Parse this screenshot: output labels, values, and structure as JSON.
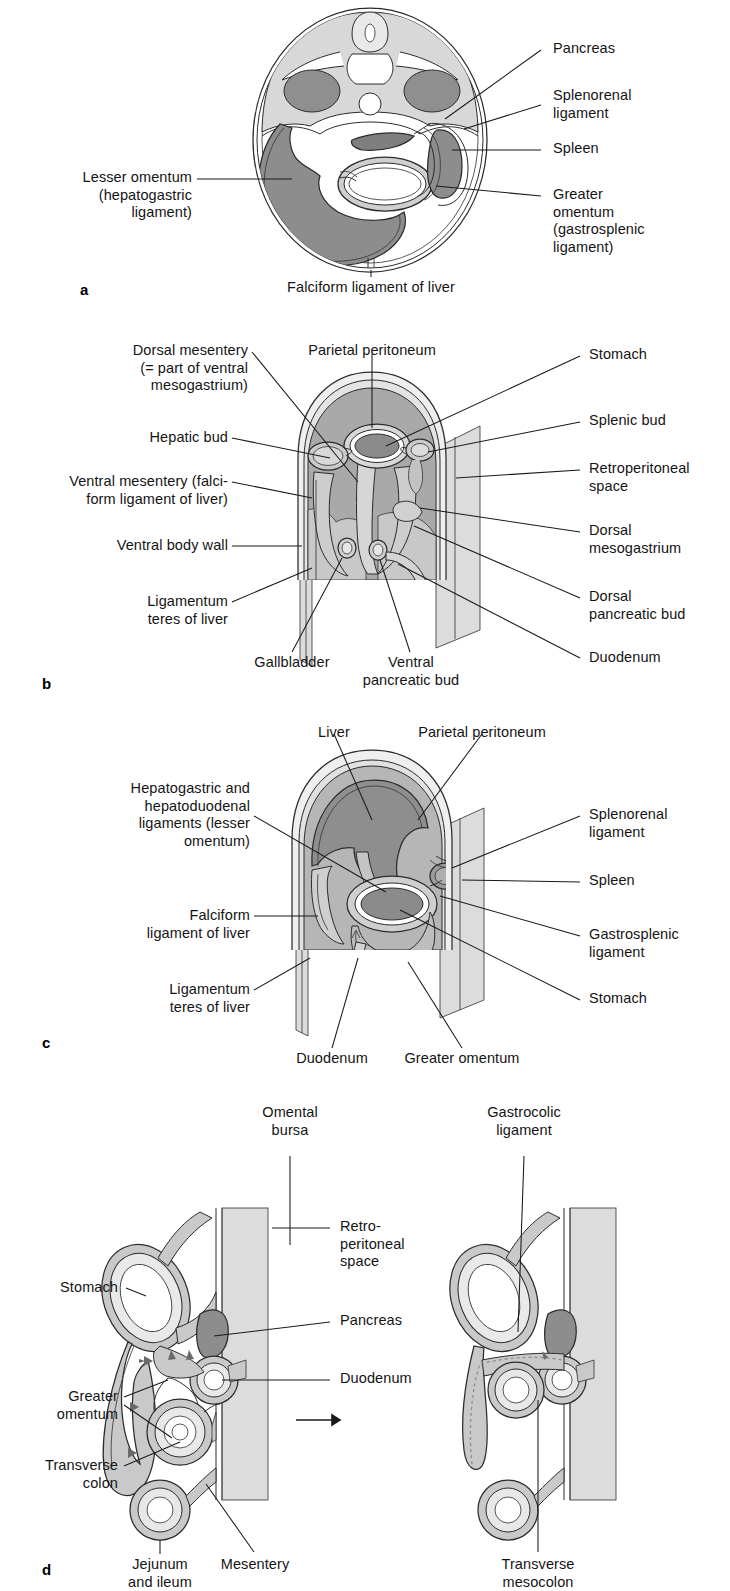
{
  "figure": {
    "caption_partial": "",
    "colors": {
      "ink": "#1a1a1a",
      "organ_dark": "#8d8d8d",
      "organ_mid": "#b3b3b3",
      "organ_light": "#d4d4d4",
      "organ_pale": "#e6e6e6",
      "lumen": "#ffffff",
      "retroperitoneal_fill": "#dcdcdc"
    }
  },
  "panels": [
    {
      "letter": "a",
      "name": "transverse-section-abdomen",
      "labels": [
        {
          "id": "a-pancreas",
          "text": "Pancreas",
          "side": "right",
          "align": "left"
        },
        {
          "id": "a-splenorenal",
          "text": "Splenorenal\nligament",
          "side": "right",
          "align": "left"
        },
        {
          "id": "a-spleen",
          "text": "Spleen",
          "side": "right",
          "align": "left"
        },
        {
          "id": "a-greater-omentum",
          "text": "Greater\nomentum\n(gastrosplenic\nligament)",
          "side": "right",
          "align": "left"
        },
        {
          "id": "a-lesser-omentum",
          "text": "Lesser omentum\n(hepatogastric\nligament)",
          "side": "left",
          "align": "right"
        },
        {
          "id": "a-falciform",
          "text": "Falciform ligament of liver",
          "side": "bottom",
          "align": "center"
        }
      ]
    },
    {
      "letter": "b",
      "name": "embryonic-mesenteries-sagittal-cutaway",
      "labels": [
        {
          "id": "b-dorsal-mesentery",
          "text": "Dorsal mesentery\n(= part of ventral\nmesogastrium)",
          "side": "left",
          "align": "right"
        },
        {
          "id": "b-hepatic-bud",
          "text": "Hepatic bud",
          "side": "left",
          "align": "right"
        },
        {
          "id": "b-ventral-mesentery",
          "text": "Ventral mesentery (falci-\nform ligament of liver)",
          "side": "left",
          "align": "right"
        },
        {
          "id": "b-ventral-body-wall",
          "text": "Ventral body wall",
          "side": "left",
          "align": "right"
        },
        {
          "id": "b-ligamentum-teres",
          "text": "Ligamentum\nteres of liver",
          "side": "left",
          "align": "right"
        },
        {
          "id": "b-parietal-periton",
          "text": "Parietal peritoneum",
          "side": "top",
          "align": "center"
        },
        {
          "id": "b-stomach",
          "text": "Stomach",
          "side": "right",
          "align": "left"
        },
        {
          "id": "b-splenic-bud",
          "text": "Splenic bud",
          "side": "right",
          "align": "left"
        },
        {
          "id": "b-retroperitoneal",
          "text": "Retroperitoneal\nspace",
          "side": "right",
          "align": "left"
        },
        {
          "id": "b-dorsal-mesogast",
          "text": "Dorsal\nmesogastrium",
          "side": "right",
          "align": "left"
        },
        {
          "id": "b-dorsal-panc-bud",
          "text": "Dorsal\npancreatic bud",
          "side": "right",
          "align": "left"
        },
        {
          "id": "b-duodenum",
          "text": "Duodenum",
          "side": "right",
          "align": "left"
        },
        {
          "id": "b-gallbladder",
          "text": "Gallbladder",
          "side": "bottom",
          "align": "center"
        },
        {
          "id": "b-ventral-panc-bud",
          "text": "Ventral\npancreatic bud",
          "side": "bottom",
          "align": "center"
        }
      ]
    },
    {
      "letter": "c",
      "name": "definitive-peritoneal-relationships",
      "labels": [
        {
          "id": "c-liver",
          "text": "Liver",
          "side": "top",
          "align": "center"
        },
        {
          "id": "c-parietal-periton",
          "text": "Parietal peritoneum",
          "side": "top",
          "align": "center"
        },
        {
          "id": "c-hepatogastric",
          "text": "Hepatogastric and\nhepatoduodenal\nligaments (lesser\nomentum)",
          "side": "left",
          "align": "right"
        },
        {
          "id": "c-falciform",
          "text": "Falciform\nligament of liver",
          "side": "left",
          "align": "right"
        },
        {
          "id": "c-ligamentum-teres",
          "text": "Ligamentum\nteres of liver",
          "side": "left",
          "align": "right"
        },
        {
          "id": "c-splenorenal",
          "text": "Splenorenal\nligament",
          "side": "right",
          "align": "left"
        },
        {
          "id": "c-spleen",
          "text": "Spleen",
          "side": "right",
          "align": "left"
        },
        {
          "id": "c-gastrosplenic",
          "text": "Gastrosplenic\nligament",
          "side": "right",
          "align": "left"
        },
        {
          "id": "c-stomach",
          "text": "Stomach",
          "side": "right",
          "align": "left"
        },
        {
          "id": "c-duodenum",
          "text": "Duodenum",
          "side": "bottom",
          "align": "center"
        },
        {
          "id": "c-greater-omentum",
          "text": "Greater omentum",
          "side": "bottom",
          "align": "center"
        }
      ]
    },
    {
      "letter": "d",
      "name": "omental-bursa-fusion-sequence",
      "labels": [
        {
          "id": "d-omental-bursa",
          "text": "Omental\nbursa",
          "side": "top",
          "align": "center"
        },
        {
          "id": "d-gastrocolic",
          "text": "Gastrocolic\nligament",
          "side": "top",
          "align": "center"
        },
        {
          "id": "d-stomach",
          "text": "Stomach",
          "side": "left",
          "align": "right"
        },
        {
          "id": "d-greater-omentum",
          "text": "Greater\nomentum",
          "side": "left",
          "align": "right"
        },
        {
          "id": "d-transverse-colon",
          "text": "Transverse\ncolon",
          "side": "left",
          "align": "right"
        },
        {
          "id": "d-retroperitoneal",
          "text": "Retro-\nperitoneal\nspace",
          "side": "mid",
          "align": "left"
        },
        {
          "id": "d-pancreas",
          "text": "Pancreas",
          "side": "mid",
          "align": "left"
        },
        {
          "id": "d-duodenum",
          "text": "Duodenum",
          "side": "mid",
          "align": "left"
        },
        {
          "id": "d-jejunum-ileum",
          "text": "Jejunum\nand ileum",
          "side": "bottom",
          "align": "center"
        },
        {
          "id": "d-mesentery",
          "text": "Mesentery",
          "side": "bottom",
          "align": "center"
        },
        {
          "id": "d-transverse-meso",
          "text": "Transverse\nmesocolon",
          "side": "bottom",
          "align": "center"
        }
      ]
    }
  ]
}
